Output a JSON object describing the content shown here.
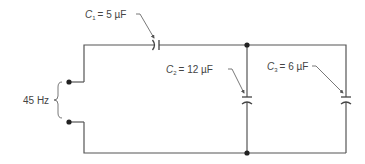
{
  "diagram": {
    "type": "circuit",
    "source": {
      "label": "45 Hz",
      "frequency_hz": 45
    },
    "components": [
      {
        "id": "C1",
        "symbol": "C",
        "subscript": "1",
        "value_text": "= 5 µF",
        "value_uF": 5,
        "placement": "series"
      },
      {
        "id": "C2",
        "symbol": "C",
        "subscript": "2",
        "value_text": "= 12 µF",
        "value_uF": 12,
        "placement": "parallel"
      },
      {
        "id": "C3",
        "symbol": "C",
        "subscript": "3",
        "value_text": "= 6 µF",
        "value_uF": 6,
        "placement": "parallel"
      }
    ],
    "colors": {
      "wire": "#555555",
      "text": "#444444",
      "background": "#ffffff"
    }
  }
}
